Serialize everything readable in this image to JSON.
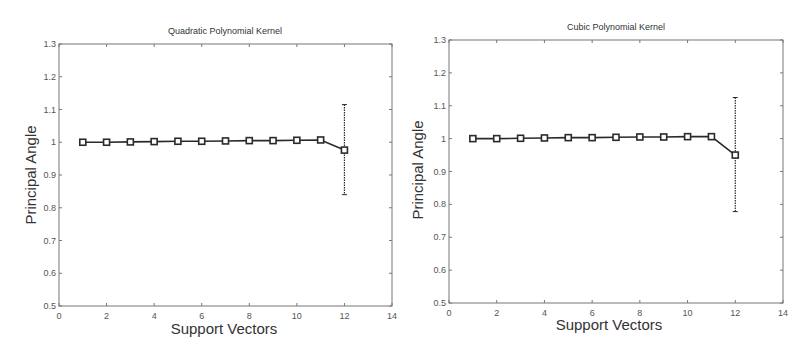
{
  "chart_data": [
    {
      "type": "line",
      "title": "Quadratic Polynomial Kernel",
      "xlabel": "Support Vectors",
      "ylabel": "Principal Angle",
      "xlim": [
        0,
        14
      ],
      "ylim": [
        0.5,
        1.3
      ],
      "xticks": [
        0,
        2,
        4,
        6,
        8,
        10,
        12,
        14
      ],
      "yticks": [
        0.5,
        0.6,
        0.7,
        0.8,
        0.9,
        1,
        1.1,
        1.2,
        1.3
      ],
      "grid": false,
      "legend": null,
      "marker": "square",
      "x": [
        1,
        2,
        3,
        4,
        5,
        6,
        7,
        8,
        9,
        10,
        11,
        12
      ],
      "values": [
        1.0,
        1.0,
        1.001,
        1.002,
        1.003,
        1.003,
        1.004,
        1.005,
        1.005,
        1.006,
        1.007,
        0.976
      ],
      "error_bars": [
        {
          "x": 12,
          "lower": 0.84,
          "upper": 1.115
        }
      ]
    },
    {
      "type": "line",
      "title": "Cubic Polynomial Kernel",
      "xlabel": "Support Vectors",
      "ylabel": "Principal Angle",
      "xlim": [
        0,
        14
      ],
      "ylim": [
        0.5,
        1.3
      ],
      "xticks": [
        0,
        2,
        4,
        6,
        8,
        10,
        12,
        14
      ],
      "yticks": [
        0.5,
        0.6,
        0.7,
        0.8,
        0.9,
        1,
        1.1,
        1.2,
        1.3
      ],
      "grid": false,
      "legend": null,
      "marker": "square",
      "x": [
        1,
        2,
        3,
        4,
        5,
        6,
        7,
        8,
        9,
        10,
        11,
        12
      ],
      "values": [
        1.0,
        1.0,
        1.001,
        1.002,
        1.003,
        1.003,
        1.004,
        1.005,
        1.005,
        1.006,
        1.006,
        0.95
      ],
      "error_bars": [
        {
          "x": 12,
          "lower": 0.778,
          "upper": 1.125
        }
      ]
    }
  ],
  "ui": {
    "left": {
      "title": "Quadratic Polynomial Kernel",
      "xlabel": "Support Vectors",
      "ylabel": "Principal Angle"
    },
    "right": {
      "title": "Cubic Polynomial Kernel",
      "xlabel": "Support Vectors",
      "ylabel": "Principal Angle"
    }
  },
  "colors": {
    "line": "#2a2a2a",
    "axis": "#777777",
    "text": "#333333"
  }
}
